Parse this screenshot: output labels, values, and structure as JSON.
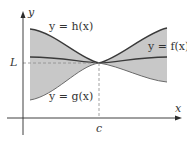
{
  "figure": {
    "axes": {
      "x_label": "x",
      "y_label": "y"
    },
    "marks": {
      "L_label": "L",
      "c_label": "c"
    },
    "curves": [
      {
        "id": "h",
        "label": "y = h(x)",
        "role": "upper bound"
      },
      {
        "id": "f",
        "label": "y = f(x)",
        "role": "squeezed function"
      },
      {
        "id": "g",
        "label": "y = g(x)",
        "role": "lower bound"
      }
    ],
    "colors": {
      "shade": "#c8c8c8",
      "curve": "#3a3a3a",
      "axis": "#2b2b2b",
      "dashed": "#8a8a8a"
    }
  }
}
